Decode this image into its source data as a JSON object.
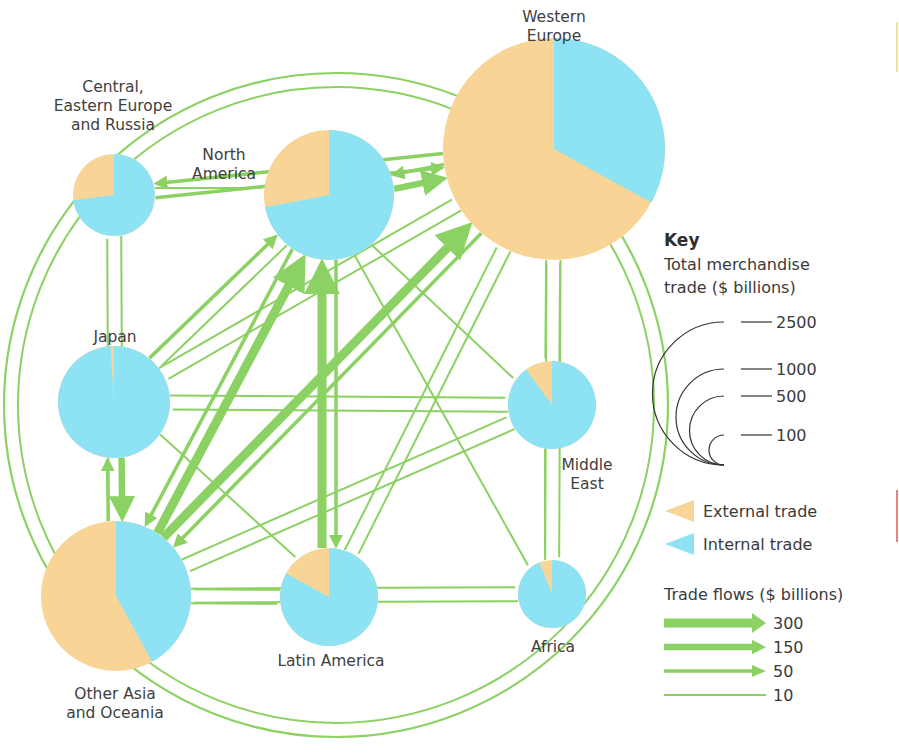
{
  "colors": {
    "external": "#F8D596",
    "internal": "#8DE3F3",
    "flow": "#8CD163",
    "key_arc": "#333333",
    "edge_yellow": "#F6E08A",
    "edge_red": "#E8847A"
  },
  "chart_data": {
    "type": "flow-map",
    "title": "",
    "regions": [
      {
        "id": "we",
        "name_lines": [
          "Western",
          "Europe"
        ],
        "total_trade_bn": 2500,
        "external_share": 0.67,
        "internal_share": 0.33
      },
      {
        "id": "na",
        "name_lines": [
          "North",
          "America"
        ],
        "total_trade_bn": 1000,
        "external_share": 0.28,
        "internal_share": 0.72
      },
      {
        "id": "cee",
        "name_lines": [
          "Central,",
          "Eastern Europe",
          "and Russia"
        ],
        "total_trade_bn": 420,
        "external_share": 0.27,
        "internal_share": 0.73
      },
      {
        "id": "jp",
        "name_lines": [
          "Japan"
        ],
        "total_trade_bn": 820,
        "external_share": 0.01,
        "internal_share": 0.99
      },
      {
        "id": "me",
        "name_lines": [
          "Middle",
          "East"
        ],
        "total_trade_bn": 500,
        "external_share": 0.1,
        "internal_share": 0.9
      },
      {
        "id": "oa",
        "name_lines": [
          "Other Asia",
          "and Oceania"
        ],
        "total_trade_bn": 1350,
        "external_share": 0.58,
        "internal_share": 0.42
      },
      {
        "id": "la",
        "name_lines": [
          "Latin America"
        ],
        "total_trade_bn": 560,
        "external_share": 0.17,
        "internal_share": 0.83
      },
      {
        "id": "af",
        "name_lines": [
          "Africa"
        ],
        "total_trade_bn": 260,
        "external_share": 0.06,
        "internal_share": 0.94
      }
    ],
    "flows": [
      {
        "from": "we",
        "to": "na",
        "value_bn": 50
      },
      {
        "from": "na",
        "to": "we",
        "value_bn": 150
      },
      {
        "from": "we",
        "to": "cee",
        "value_bn": 50
      },
      {
        "from": "cee",
        "to": "we",
        "value_bn": 50
      },
      {
        "from": "cee",
        "to": "na",
        "value_bn": 10
      },
      {
        "from": "jp",
        "to": "na",
        "value_bn": 50
      },
      {
        "from": "na",
        "to": "jp",
        "value_bn": 10
      },
      {
        "from": "jp",
        "to": "we",
        "value_bn": 10
      },
      {
        "from": "we",
        "to": "jp",
        "value_bn": 10
      },
      {
        "from": "jp",
        "to": "me",
        "value_bn": 10
      },
      {
        "from": "me",
        "to": "jp",
        "value_bn": 10
      },
      {
        "from": "jp",
        "to": "oa",
        "value_bn": 150
      },
      {
        "from": "oa",
        "to": "jp",
        "value_bn": 50
      },
      {
        "from": "jp",
        "to": "la",
        "value_bn": 10
      },
      {
        "from": "oa",
        "to": "na",
        "value_bn": 300
      },
      {
        "from": "na",
        "to": "oa",
        "value_bn": 50
      },
      {
        "from": "oa",
        "to": "we",
        "value_bn": 300
      },
      {
        "from": "we",
        "to": "oa",
        "value_bn": 50
      },
      {
        "from": "la",
        "to": "na",
        "value_bn": 300
      },
      {
        "from": "na",
        "to": "la",
        "value_bn": 50
      },
      {
        "from": "we",
        "to": "me",
        "value_bn": 10
      },
      {
        "from": "me",
        "to": "we",
        "value_bn": 10
      },
      {
        "from": "me",
        "to": "oa",
        "value_bn": 10
      },
      {
        "from": "oa",
        "to": "me",
        "value_bn": 10
      },
      {
        "from": "me",
        "to": "af",
        "value_bn": 10
      },
      {
        "from": "na",
        "to": "me",
        "value_bn": 10
      },
      {
        "from": "na",
        "to": "af",
        "value_bn": 10
      },
      {
        "from": "la",
        "to": "we",
        "value_bn": 10
      },
      {
        "from": "we",
        "to": "la",
        "value_bn": 10
      },
      {
        "from": "af",
        "to": "oa",
        "value_bn": 10
      },
      {
        "from": "oa",
        "to": "la",
        "value_bn": 10
      },
      {
        "from": "la",
        "to": "oa",
        "value_bn": 10
      },
      {
        "from": "oa",
        "to": "af",
        "value_bn": 10
      },
      {
        "from": "af",
        "to": "we",
        "value_bn": 10
      },
      {
        "from": "we",
        "to": "af",
        "value_bn": 10
      },
      {
        "from": "cee",
        "to": "oa",
        "value_bn": 10
      },
      {
        "from": "oa",
        "to": "cee",
        "value_bn": 10
      }
    ],
    "legend": {
      "title": "Key",
      "size_title_lines": [
        "Total merchandise",
        "trade ($ billions)"
      ],
      "size_values": [
        2500,
        1000,
        500,
        100
      ],
      "share_items": [
        {
          "label": "External trade",
          "kind": "external"
        },
        {
          "label": "Internal trade",
          "kind": "internal"
        }
      ],
      "flow_title": "Trade flows ($ billions)",
      "flow_values": [
        300,
        150,
        50,
        10
      ],
      "placement": "right"
    }
  }
}
